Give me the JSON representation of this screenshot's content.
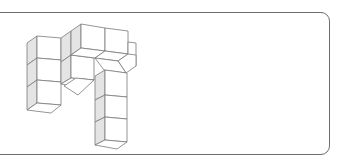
{
  "figure": {
    "type": "isometric-cube-structure",
    "colors": {
      "edge": "#7a7a7a",
      "shaded_face": "#e4e4e4",
      "light_face": "#ffffff",
      "frame_border": "#6e6e6e"
    },
    "columns": [
      {
        "name": "left-column",
        "cube_count": 3
      },
      {
        "name": "middle-column",
        "cube_count": 2
      },
      {
        "name": "top-arm",
        "cube_count": 2
      },
      {
        "name": "right-column",
        "cube_count": 3
      }
    ]
  }
}
